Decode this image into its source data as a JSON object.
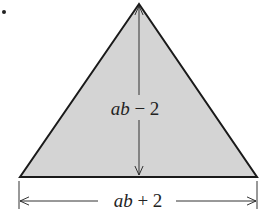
{
  "figure": {
    "shape": "triangle",
    "fill_color": "#d4d4d4",
    "stroke_color": "#1a1a1a",
    "height_label": {
      "var": "ab",
      "rest": " − 2"
    },
    "base_label": {
      "var": "ab",
      "rest": " + 2"
    }
  }
}
